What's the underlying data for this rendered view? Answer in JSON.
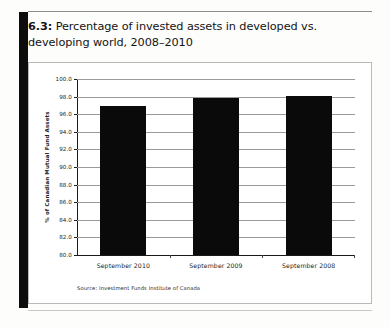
{
  "figure": {
    "number": "6.3:",
    "caption": "Percentage of invested assets in developed vs. developing world, 2008–2010"
  },
  "source_note": "Source: Investment Funds Institute of Canada",
  "chart_data": {
    "type": "bar",
    "title": "Percentage of invested assets in developed vs. developing world, 2008–2010",
    "categories": [
      "September 2010",
      "September 2009",
      "September 2008"
    ],
    "values": [
      96.9,
      97.8,
      98.1
    ],
    "xlabel": "",
    "ylabel": "% of Canadian Mutual Fund Assets",
    "ylim": [
      80.0,
      100.0
    ],
    "ytick_step": 2.0,
    "yticks": [
      "100.0",
      "98.0",
      "96.0",
      "94.0",
      "92.0",
      "90.0",
      "88.0",
      "86.0",
      "84.0",
      "82.0",
      "80.0"
    ],
    "grid": true,
    "legend": "none",
    "bar_color": "#0a0a0a",
    "gridline_color": "#9a9a9a"
  }
}
